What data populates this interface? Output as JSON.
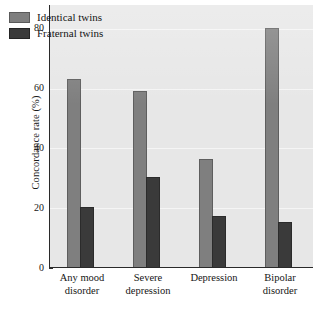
{
  "chart_data": {
    "type": "bar",
    "title": "",
    "subtitle": "",
    "xlabel": "",
    "ylabel": "Concordance rate (%)",
    "categories": [
      "Any mood disorder",
      "Severe depression",
      "Depression",
      "Bipolar disorder"
    ],
    "category_lines": [
      [
        "Any mood",
        "disorder"
      ],
      [
        "Severe",
        "depression"
      ],
      [
        "Depression",
        ""
      ],
      [
        "Bipolar",
        "disorder"
      ]
    ],
    "series": [
      {
        "name": "Identical twins",
        "color": "#7f7f7f",
        "values": [
          63,
          59,
          36,
          80
        ]
      },
      {
        "name": "Fraternal twins",
        "color": "#3a3a3a",
        "values": [
          20,
          30,
          17,
          15
        ]
      }
    ],
    "ylim": [
      0,
      88
    ],
    "yticks": [
      0,
      20,
      40,
      60,
      80
    ],
    "ytick_labels": [
      "0",
      "20",
      "40",
      "60",
      "80"
    ],
    "grid": true,
    "grid_axis": "y",
    "legend_position": "top-left",
    "plot_background": "#e7e7e7",
    "figure_background": "#ffffff",
    "axis_color": "#2a2a2a",
    "gridline_color": "#f6f6f6"
  },
  "legend": {
    "entries": [
      {
        "label": "Identical twins",
        "swatch": "identical"
      },
      {
        "label": "Fraternal twins",
        "swatch": "fraternal"
      }
    ]
  },
  "axes": {
    "y_title": "Concordance rate (%)"
  }
}
